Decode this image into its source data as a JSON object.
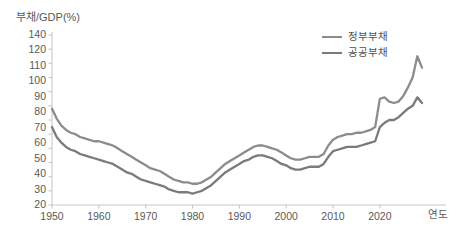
{
  "chart_data": {
    "type": "line",
    "title": "",
    "ylabel": "부채/GDP(%)",
    "xlabel": "연도",
    "xlim": [
      1950,
      2029
    ],
    "ylim": [
      20,
      140
    ],
    "grid": false,
    "legend_position": "top-right",
    "ytick_labels": [
      "140",
      "120",
      "110",
      "100",
      "90",
      "80",
      "70",
      "60",
      "50",
      "40",
      "30",
      "20"
    ],
    "ytick_values": [
      140,
      130,
      120,
      110,
      100,
      90,
      80,
      70,
      60,
      50,
      40,
      30,
      20
    ],
    "xtick_labels": [
      "1950",
      "1960",
      "1970",
      "1980",
      "1990",
      "2000",
      "2010",
      "2020"
    ],
    "xtick_values": [
      1950,
      1960,
      1970,
      1980,
      1990,
      2000,
      2010,
      2020
    ],
    "colors": {
      "government_debt": "#8c8c8c",
      "public_debt": "#7b7b7b",
      "axis": "#c8c8c8",
      "text": "#5a5a5a"
    },
    "x": [
      1950,
      1951,
      1952,
      1953,
      1954,
      1955,
      1956,
      1957,
      1958,
      1959,
      1960,
      1961,
      1962,
      1963,
      1964,
      1965,
      1966,
      1967,
      1968,
      1969,
      1970,
      1971,
      1972,
      1973,
      1974,
      1975,
      1976,
      1977,
      1978,
      1979,
      1980,
      1981,
      1982,
      1983,
      1984,
      1985,
      1986,
      1987,
      1988,
      1989,
      1990,
      1991,
      1992,
      1993,
      1994,
      1995,
      1996,
      1997,
      1998,
      1999,
      2000,
      2001,
      2002,
      2003,
      2004,
      2005,
      2006,
      2007,
      2008,
      2009,
      2010,
      2011,
      2012,
      2013,
      2014,
      2015,
      2016,
      2017,
      2018,
      2019,
      2020,
      2021,
      2022,
      2023,
      2024,
      2025,
      2026,
      2027,
      2028,
      2029
    ],
    "series": [
      {
        "name": "정부부채",
        "color": "#8c8c8c",
        "values": [
          88,
          81,
          76,
          73,
          71,
          70,
          68,
          67,
          66,
          65,
          65,
          64,
          63,
          62,
          60,
          58,
          56,
          54,
          52,
          50,
          48,
          46,
          45,
          44,
          42,
          40,
          38,
          37,
          36,
          36,
          35,
          35,
          36,
          38,
          40,
          43,
          46,
          49,
          51,
          53,
          55,
          57,
          59,
          61,
          62,
          62,
          61,
          60,
          59,
          57,
          55,
          53,
          52,
          52,
          53,
          54,
          54,
          54,
          56,
          62,
          66,
          68,
          69,
          70,
          70,
          71,
          71,
          72,
          73,
          75,
          95,
          96,
          93,
          92,
          93,
          97,
          103,
          110,
          125,
          117
        ]
      },
      {
        "name": "공공부채",
        "color": "#7b7b7b",
        "values": [
          75,
          68,
          64,
          61,
          59,
          58,
          56,
          55,
          54,
          53,
          52,
          51,
          50,
          49,
          47,
          45,
          43,
          42,
          40,
          38,
          37,
          36,
          35,
          34,
          33,
          31,
          30,
          29,
          29,
          29,
          28,
          29,
          30,
          32,
          34,
          37,
          40,
          43,
          45,
          47,
          49,
          51,
          52,
          54,
          55,
          55,
          54,
          53,
          51,
          49,
          48,
          46,
          45,
          45,
          46,
          47,
          47,
          47,
          49,
          54,
          58,
          59,
          60,
          61,
          61,
          61,
          62,
          63,
          64,
          65,
          75,
          78,
          80,
          80,
          82,
          85,
          88,
          90,
          96,
          92
        ]
      }
    ]
  },
  "legend": {
    "items": [
      {
        "label": "정부부채",
        "color": "#8c8c8c"
      },
      {
        "label": "공공부채",
        "color": "#7b7b7b"
      }
    ]
  },
  "axes": {
    "y_title": "부채/GDP(%)",
    "x_title": "연도"
  }
}
